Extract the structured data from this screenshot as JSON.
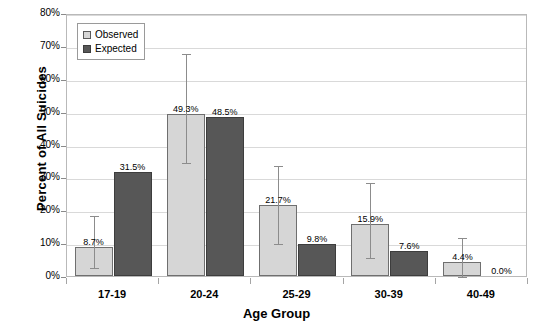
{
  "chart_data": {
    "type": "bar",
    "title": "",
    "xlabel": "Age Group",
    "ylabel": "Percent of All Suicides",
    "categories": [
      "17-19",
      "20-24",
      "25-29",
      "30-39",
      "40-49"
    ],
    "ylim": [
      0,
      80
    ],
    "ytick_labels": [
      "0%",
      "10%",
      "20%",
      "30%",
      "40%",
      "50%",
      "60%",
      "70%",
      "80%"
    ],
    "ytick_values": [
      0,
      10,
      20,
      30,
      40,
      50,
      60,
      70,
      80
    ],
    "grid": true,
    "legend_position": "top-left",
    "series": [
      {
        "name": "Observed",
        "color": "#d6d6d6",
        "values": [
          8.7,
          49.3,
          21.7,
          15.9,
          4.4
        ],
        "value_labels": [
          "8.7%",
          "49.3%",
          "21.7%",
          "15.9%",
          "4.4%"
        ],
        "error_low": [
          3.0,
          35.0,
          10.2,
          6.2,
          0.3
        ],
        "error_high": [
          19.0,
          68.2,
          34.0,
          29.0,
          12.2
        ]
      },
      {
        "name": "Expected",
        "color": "#575757",
        "values": [
          31.5,
          48.5,
          9.8,
          7.6,
          0.0
        ],
        "value_labels": [
          "31.5%",
          "48.5%",
          "9.8%",
          "7.6%",
          "0.0%"
        ]
      }
    ]
  },
  "legend": {
    "items": [
      {
        "label": "Observed",
        "swatch": "observed"
      },
      {
        "label": "Expected",
        "swatch": "expected"
      }
    ]
  }
}
